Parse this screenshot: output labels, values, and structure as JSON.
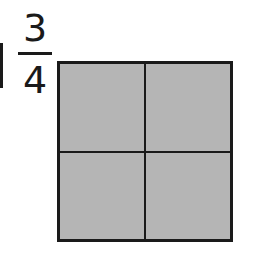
{
  "fraction": {
    "numerator": "3",
    "denominator": "4"
  },
  "grid": {
    "rows": 2,
    "columns": 2,
    "cells": [
      {
        "shaded": true,
        "color": "#b5b5b5"
      },
      {
        "shaded": true,
        "color": "#b5b5b5"
      },
      {
        "shaded": true,
        "color": "#b5b5b5"
      },
      {
        "shaded": true,
        "color": "#b5b5b5"
      }
    ],
    "border_color": "#1a1a1a"
  }
}
